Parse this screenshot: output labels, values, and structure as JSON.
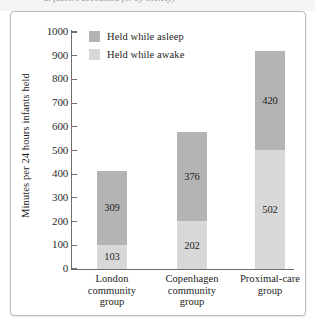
{
  "page": {
    "cutoff_caption": "al factors accounted for by society)"
  },
  "chart_data": {
    "type": "bar",
    "subtype": "stacked-bar",
    "title": "",
    "xlabel": "",
    "ylabel": "Minutes per 24 hours infants held",
    "ylim": [
      0,
      1000
    ],
    "ytick_step": 100,
    "yticks": [
      "1000",
      "900",
      "800",
      "700",
      "600",
      "500",
      "400",
      "300",
      "200",
      "100",
      "0"
    ],
    "grid": false,
    "legend_position": "top-left-inside",
    "categories": [
      "London community group",
      "Copenhagen community group",
      "Proximal-care group"
    ],
    "category_lines": [
      [
        "London",
        "community",
        "group"
      ],
      [
        "Copenhagen",
        "community",
        "group"
      ],
      [
        "Proximal-care",
        "group"
      ]
    ],
    "series": [
      {
        "name": "Held while awake",
        "color": "#d8d8d8",
        "values": [
          103,
          202,
          502
        ],
        "stack_position": "bottom"
      },
      {
        "name": "Held while asleep",
        "color": "#b4b4b4",
        "values": [
          309,
          376,
          420
        ],
        "stack_position": "top"
      }
    ],
    "totals": [
      412,
      578,
      922
    ]
  },
  "legend": {
    "items": [
      {
        "label": "Held while asleep",
        "color": "#b4b4b4"
      },
      {
        "label": "Held while awake",
        "color": "#d8d8d8"
      }
    ]
  },
  "colors": {
    "asleep": "#b4b4b4",
    "awake": "#d8d8d8",
    "axis": "#6e6e6e",
    "text": "#1d1d1d",
    "frame": "#b9b9b9"
  }
}
